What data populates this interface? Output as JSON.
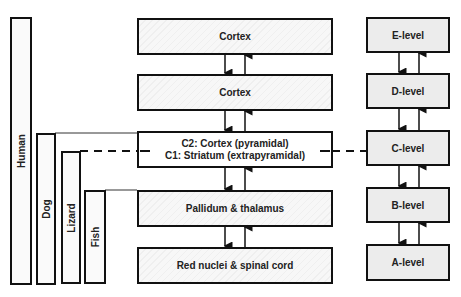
{
  "species": [
    {
      "label": "Human"
    },
    {
      "label": "Dog"
    },
    {
      "label": "Lizard"
    },
    {
      "label": "Fish"
    }
  ],
  "structures": [
    {
      "label": "Cortex"
    },
    {
      "label": "Cortex"
    },
    {
      "label_top": "C2: Cortex (pyramidal)",
      "label_bottom": "C1: Striatum (extrapyramidal)"
    },
    {
      "label": "Pallidum & thalamus"
    },
    {
      "label": "Red nuclei & spinal cord"
    }
  ],
  "levels": [
    {
      "label": "E-level"
    },
    {
      "label": "D-level"
    },
    {
      "label": "C-level"
    },
    {
      "label": "B-level"
    },
    {
      "label": "A-level"
    }
  ]
}
